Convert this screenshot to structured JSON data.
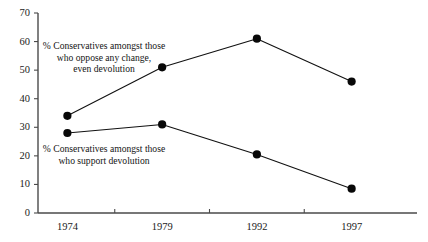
{
  "chart_data": {
    "type": "line",
    "title": "",
    "subtitle": "",
    "xlabel": "",
    "ylabel": "",
    "categories": [
      "1974",
      "1979",
      "1992",
      "1997"
    ],
    "ylim": [
      0,
      70
    ],
    "yticks": [
      0,
      10,
      20,
      30,
      40,
      50,
      60,
      70
    ],
    "ytick_labels": [
      "0",
      "10",
      "20",
      "30",
      "40",
      "50",
      "60",
      "70"
    ],
    "grid": false,
    "legend_position": "inline-annotations",
    "series": [
      {
        "name": "% Conservatives amongst those who oppose any change, even devolution",
        "values": [
          34,
          51,
          61,
          46
        ],
        "marker": "filled-circle",
        "color": "#080808"
      },
      {
        "name": "% Conservatives amongst those who support devolution",
        "values": [
          28,
          31,
          20.5,
          8.5
        ],
        "marker": "filled-circle",
        "color": "#080808"
      }
    ],
    "annotations": [
      {
        "id": "oppose-label",
        "lines": [
          "% Conservatives amongst those",
          "who oppose any change,",
          "even devolution"
        ]
      },
      {
        "id": "support-label",
        "lines": [
          "% Conservatives amongst those",
          "who support devolution"
        ]
      }
    ]
  }
}
